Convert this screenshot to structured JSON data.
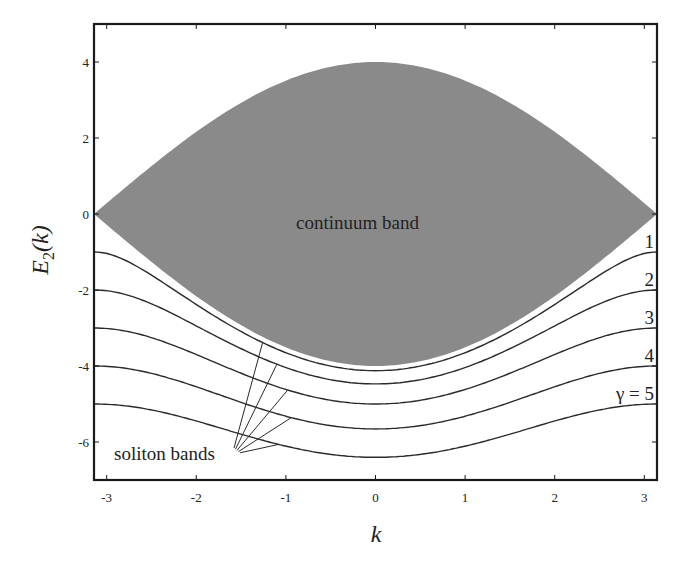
{
  "chart_data": {
    "type": "area",
    "title": "",
    "xlabel": "k",
    "ylabel": "E_2(k)",
    "ylabel_main": "E",
    "ylabel_sub": "2",
    "ylabel_arg": "(k)",
    "xlim": [
      -3.1416,
      3.1416
    ],
    "ylim": [
      -7,
      5
    ],
    "grid": false,
    "legend": "none",
    "x_ticks": [
      -3,
      -2,
      -1,
      0,
      1,
      2,
      3
    ],
    "x_tick_labels": [
      "-3",
      "-2",
      "-1",
      "0",
      "1",
      "2",
      "3"
    ],
    "y_ticks": [
      4,
      2,
      0,
      -2,
      -4,
      -6
    ],
    "y_tick_labels": [
      "4",
      "2",
      "0",
      "-2",
      "-4",
      "-6"
    ],
    "continuum_band": {
      "label": "continuum band",
      "formula": "E = ±4 cos(k/2)",
      "upper_max_at_k0": 4.0,
      "lower_min_at_k0": -4.0,
      "edge_value_at_k_pi": 0,
      "fill_color": "#8a8a8a"
    },
    "series": [
      {
        "name": "1",
        "gamma": 1,
        "value_at_k0": -4.12,
        "value_at_k_pi": -1.0
      },
      {
        "name": "2",
        "gamma": 2,
        "value_at_k0": -4.47,
        "value_at_k_pi": -2.0
      },
      {
        "name": "3",
        "gamma": 3,
        "value_at_k0": -5.0,
        "value_at_k_pi": -3.0
      },
      {
        "name": "4",
        "gamma": 4,
        "value_at_k0": -5.66,
        "value_at_k_pi": -4.0
      },
      {
        "name": "γ = 5",
        "gamma": 5,
        "value_at_k0": -6.4,
        "value_at_k_pi": -5.0
      }
    ],
    "series_formula": "E = -sqrt(γ² + 16 cos²(k/2))",
    "annotations": [
      {
        "text": "continuum band",
        "x": -0.85,
        "y": -0.2
      },
      {
        "text": "soliton bands",
        "x": -2.7,
        "y": -6.3,
        "points_to": "curves 1–5 near k ≈ -1.2"
      }
    ],
    "curve_labels": [
      "1",
      "2",
      "3",
      "4",
      "γ = 5"
    ]
  }
}
